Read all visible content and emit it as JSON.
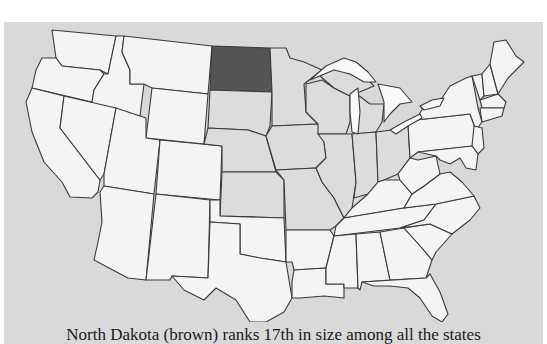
{
  "map": {
    "title": "United States map",
    "background_color": "#d9d9d9",
    "default_state_fill": "#f4f4f4",
    "midwest_state_fill": "#dcdcdc",
    "highlight_fill": "#555555",
    "highlighted_state": "North Dakota",
    "midwest_states": [
      "South Dakota",
      "Nebraska",
      "Kansas",
      "Minnesota",
      "Iowa",
      "Missouri",
      "Wisconsin",
      "Illinois",
      "Michigan",
      "Indiana",
      "Ohio"
    ]
  },
  "caption": {
    "text": "North Dakota (brown) ranks 17th in size among all the states"
  }
}
